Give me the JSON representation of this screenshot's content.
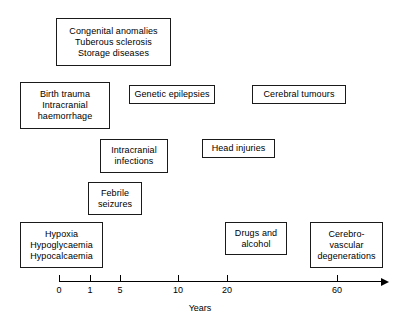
{
  "diagram": {
    "boxes": [
      {
        "name": "congenital-anomalies",
        "lines": [
          "Congenital anomalies",
          "Tuberous sclerosis",
          "Storage diseases"
        ],
        "x": 56,
        "y": 18,
        "w": 115,
        "h": 48
      },
      {
        "name": "birth-trauma",
        "lines": [
          "Birth trauma",
          "Intracranial",
          "haemorrhage"
        ],
        "x": 20,
        "y": 82,
        "w": 90,
        "h": 47
      },
      {
        "name": "genetic-epilepsies",
        "lines": [
          "Genetic epilepsies"
        ],
        "x": 129,
        "y": 85,
        "w": 86,
        "h": 19
      },
      {
        "name": "cerebral-tumours",
        "lines": [
          "Cerebral tumours"
        ],
        "x": 252,
        "y": 85,
        "w": 94,
        "h": 19
      },
      {
        "name": "intracranial-infections",
        "lines": [
          "Intracranial",
          "infections"
        ],
        "x": 100,
        "y": 139,
        "w": 68,
        "h": 34
      },
      {
        "name": "head-injuries",
        "lines": [
          "Head injuries"
        ],
        "x": 202,
        "y": 139,
        "w": 73,
        "h": 19
      },
      {
        "name": "febrile-seizures",
        "lines": [
          "Febrile",
          "seizures"
        ],
        "x": 88,
        "y": 182,
        "w": 54,
        "h": 33
      },
      {
        "name": "hypoxia-hypoglycaemia-hypocalcaemia",
        "lines": [
          "Hypoxia",
          "Hypoglycaemia",
          "Hypocalcaemia"
        ],
        "x": 20,
        "y": 222,
        "w": 83,
        "h": 46
      },
      {
        "name": "drugs-and-alcohol",
        "lines": [
          "Drugs and",
          "alcohol"
        ],
        "x": 225,
        "y": 222,
        "w": 62,
        "h": 33
      },
      {
        "name": "cerebrovascular-degenerations",
        "lines": [
          "Cerebro-",
          "vascular",
          "degenerations"
        ],
        "x": 310,
        "y": 222,
        "w": 73,
        "h": 46
      }
    ],
    "axis": {
      "label": "Years",
      "label_x": 200,
      "label_y": 303,
      "line_x": 59,
      "line_y": 281,
      "line_w": 327,
      "arrow_x": 381,
      "ticks": [
        {
          "label": "0",
          "x": 59
        },
        {
          "label": "1",
          "x": 90
        },
        {
          "label": "5",
          "x": 120
        },
        {
          "label": "10",
          "x": 178
        },
        {
          "label": "20",
          "x": 227
        },
        {
          "label": "60",
          "x": 337
        }
      ]
    },
    "colors": {
      "stroke": "#1a1a1a",
      "text": "#000000",
      "background": "#ffffff"
    }
  }
}
